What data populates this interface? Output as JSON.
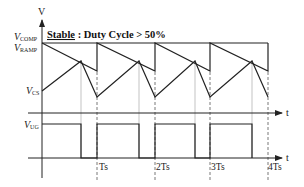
{
  "diagram": {
    "title_underlined": "Stable",
    "title_rest": " : Duty Cycle > 50%",
    "y_axis_label": "V",
    "x_axis_label_upper": "t",
    "x_axis_label_lower": "t",
    "signals": {
      "v_comp": {
        "main": "V",
        "sub": "COMP"
      },
      "v_ramp": {
        "main": "V",
        "sub": "RAMP"
      },
      "v_cs": {
        "main": "V",
        "sub": "CS"
      },
      "v_ug": {
        "main": "V",
        "sub": "UG"
      }
    },
    "ticks": [
      "Ts",
      "2Ts",
      "3Ts",
      "4Ts"
    ],
    "colors": {
      "line": "#222222",
      "dashed": "#555555",
      "dotted": "#999999"
    }
  }
}
